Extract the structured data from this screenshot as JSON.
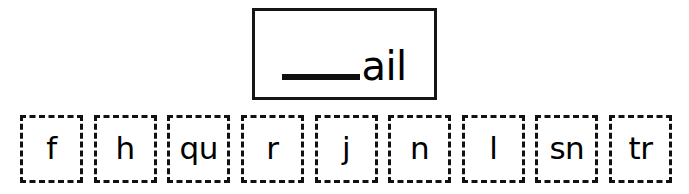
{
  "worksheet": {
    "word_box": {
      "blank": "blank-line",
      "ending": "ail"
    },
    "tiles": [
      {
        "label": "f"
      },
      {
        "label": "h"
      },
      {
        "label": "qu"
      },
      {
        "label": "r"
      },
      {
        "label": "j"
      },
      {
        "label": "n"
      },
      {
        "label": "l"
      },
      {
        "label": "sn"
      },
      {
        "label": "tr"
      }
    ]
  },
  "colors": {
    "ink": "#111111",
    "background": "#ffffff"
  }
}
